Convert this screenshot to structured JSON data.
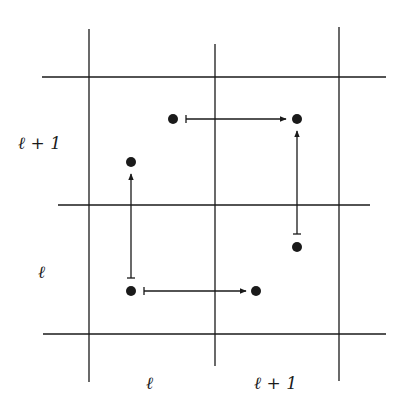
{
  "diagram": {
    "grid": {
      "vertical_lines": [
        {
          "x": 89,
          "y1": 29,
          "y2": 382
        },
        {
          "x": 215,
          "y1": 44,
          "y2": 366
        },
        {
          "x": 339,
          "y1": 27,
          "y2": 381
        }
      ],
      "horizontal_lines": [
        {
          "y": 77,
          "x1": 42,
          "x2": 386
        },
        {
          "y": 205,
          "x1": 58,
          "x2": 370
        },
        {
          "y": 334,
          "x1": 43,
          "x2": 386
        }
      ]
    },
    "row_labels": [
      {
        "text": "ℓ + 1",
        "x": 18,
        "y": 149
      },
      {
        "text": "ℓ",
        "x": 38,
        "y": 278
      }
    ],
    "column_labels": [
      {
        "text": "ℓ",
        "x": 146,
        "y": 389
      },
      {
        "text": "ℓ + 1",
        "x": 254,
        "y": 389
      }
    ],
    "points": [
      {
        "x": 173,
        "y": 119
      },
      {
        "x": 297,
        "y": 119
      },
      {
        "x": 131,
        "y": 162
      },
      {
        "x": 131,
        "y": 291
      },
      {
        "x": 256,
        "y": 291
      },
      {
        "x": 297,
        "y": 247
      }
    ],
    "arrows": [
      {
        "from": [
          186,
          119
        ],
        "to": [
          286,
          119
        ],
        "direction": "right"
      },
      {
        "from": [
          144,
          291
        ],
        "to": [
          246,
          291
        ],
        "direction": "right"
      },
      {
        "from": [
          131,
          278
        ],
        "to": [
          131,
          174
        ],
        "direction": "up"
      },
      {
        "from": [
          297,
          234
        ],
        "to": [
          297,
          131
        ],
        "direction": "up"
      }
    ],
    "colors": {
      "line": "#1a1a1a",
      "background": "#ffffff"
    }
  }
}
